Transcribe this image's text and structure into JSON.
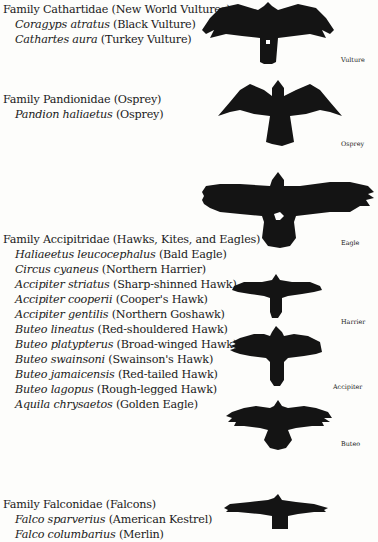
{
  "families": [
    {
      "title": "Family Cathartidae (New World Vultures)",
      "species": [
        {
          "scientific": "Coragyps atratus",
          "common": "(Black Vulture)"
        },
        {
          "scientific": "Cathartes aura",
          "common": "(Turkey Vulture)"
        }
      ]
    },
    {
      "title": "Family Pandionidae (Osprey)",
      "species": [
        {
          "scientific": "Pandion haliaetus",
          "common": "(Osprey)"
        }
      ]
    },
    {
      "title": "Family Accipitridae (Hawks, Kites, and Eagles)",
      "species": [
        {
          "scientific": "Haliaeetus leucocephalus",
          "common": "(Bald Eagle)"
        },
        {
          "scientific": "Circus cyaneus",
          "common": "(Northern Harrier)"
        },
        {
          "scientific": "Accipiter striatus",
          "common": "(Sharp-shinned Hawk)"
        },
        {
          "scientific": "Accipiter cooperii",
          "common": "(Cooper's Hawk)"
        },
        {
          "scientific": "Accipiter gentilis",
          "common": "(Northern Goshawk)"
        },
        {
          "scientific": "Buteo lineatus",
          "common": "(Red-shouldered Hawk)"
        },
        {
          "scientific": "Buteo platypterus",
          "common": "(Broad-winged Hawk)"
        },
        {
          "scientific": "Buteo swainsoni",
          "common": "(Swainson's Hawk)"
        },
        {
          "scientific": "Buteo jamaicensis",
          "common": "(Red-tailed Hawk)"
        },
        {
          "scientific": "Buteo lagopus",
          "common": "(Rough-legged Hawk)"
        },
        {
          "scientific": "Aquila chrysaetos",
          "common": "(Golden Eagle)"
        }
      ]
    },
    {
      "title": "Family Falconidae (Falcons)",
      "species": [
        {
          "scientific": "Falco sparverius",
          "common": "(American Kestrel)"
        },
        {
          "scientific": "Falco columbarius",
          "common": "(Merlin)"
        }
      ]
    }
  ],
  "silhouettes": [
    {
      "label": "Vulture",
      "icon": "vulture-silhouette-icon"
    },
    {
      "label": "Osprey",
      "icon": "osprey-silhouette-icon"
    },
    {
      "label": "Eagle",
      "icon": "eagle-silhouette-icon"
    },
    {
      "label": "Harrier",
      "icon": "harrier-silhouette-icon"
    },
    {
      "label": "Accipiter",
      "icon": "accipiter-silhouette-icon"
    },
    {
      "label": "Buteo",
      "icon": "buteo-silhouette-icon"
    },
    {
      "label": "",
      "icon": "falcon-silhouette-icon"
    }
  ],
  "colors": {
    "silhouette": "#141414",
    "background": "#fdfdfb",
    "text": "#1a1a1a"
  }
}
